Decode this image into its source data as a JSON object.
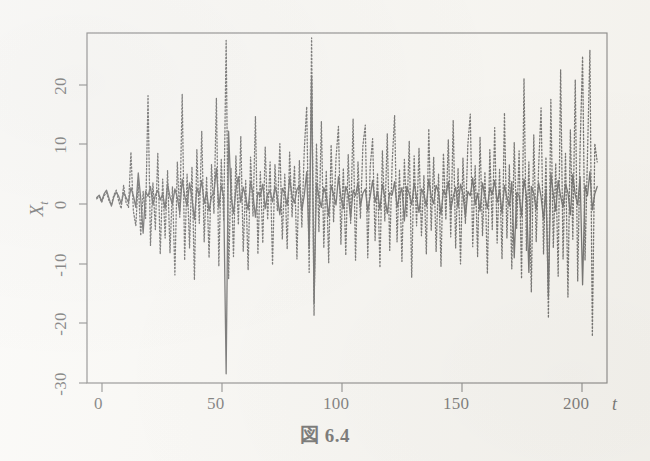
{
  "figure": {
    "caption": "図 6.4",
    "background_color": "#f7f6f2",
    "ink_color": "#111111"
  },
  "axes": {
    "y_title": "X",
    "y_subscript": "t",
    "x_title": "t",
    "y_ticks": [
      "20",
      "10",
      "0",
      "-10",
      "-20",
      "-30"
    ],
    "x_ticks": [
      "0",
      "50",
      "100",
      "150",
      "200"
    ]
  },
  "chart_data": {
    "type": "line",
    "title": "図 6.4",
    "xlabel": "t",
    "ylabel": "X_t",
    "xlim": [
      -4,
      209
    ],
    "ylim": [
      -30,
      27
    ],
    "yticks": [
      20,
      10,
      0,
      -10,
      -20,
      -30
    ],
    "xticks": [
      0,
      50,
      100,
      150,
      200
    ],
    "grid": false,
    "legend": "none",
    "series": [
      {
        "name": "solid-series",
        "style": "solid",
        "color": "#111111",
        "linewidth": 1.3,
        "values": [
          0.2,
          0.6,
          -0.4,
          0.8,
          1.4,
          0.1,
          -1.2,
          0.3,
          1.1,
          0.4,
          -0.8,
          1.0,
          0.2,
          -0.6,
          1.8,
          0.5,
          -1.4,
          4.2,
          0.1,
          -5.6,
          1.2,
          0.4,
          2.0,
          -1.0,
          0.6,
          1.4,
          -0.2,
          0.8,
          -1.6,
          2.4,
          0.3,
          -0.9,
          1.6,
          0.2,
          -2.2,
          3.2,
          0.5,
          -1.2,
          2.6,
          0.1,
          -3.4,
          1.8,
          0.6,
          3.0,
          -0.8,
          1.2,
          -2.0,
          0.4,
          1.0,
          5.0,
          -1.4,
          2.2,
          0.3,
          -28.5,
          11.0,
          0.6,
          -2.4,
          1.5,
          3.6,
          -0.6,
          1.9,
          0.2,
          -1.8,
          2.8,
          0.7,
          -3.0,
          1.1,
          0.4,
          2.4,
          -1.6,
          0.8,
          1.3,
          -0.5,
          2.0,
          0.2,
          -2.6,
          1.7,
          0.9,
          -1.1,
          3.4,
          0.4,
          -0.7,
          1.5,
          2.2,
          -1.9,
          0.6,
          4.4,
          -8.0,
          20.0,
          -17.0,
          2.6,
          0.3,
          -1.4,
          1.8,
          0.5,
          -2.8,
          2.2,
          0.7,
          -1.0,
          3.6,
          0.2,
          -1.6,
          2.0,
          0.8,
          -3.2,
          1.4,
          0.5,
          2.6,
          -1.2,
          0.9,
          1.6,
          -2.0,
          0.4,
          3.0,
          -0.6,
          1.2,
          -1.8,
          2.4,
          0.3,
          -2.4,
          1.0,
          0.6,
          2.8,
          -1.4,
          0.5,
          1.8,
          -3.6,
          2.0,
          0.8,
          -1.0,
          2.6,
          0.2,
          -2.2,
          1.6,
          0.7,
          -1.2,
          3.2,
          0.4,
          -0.8,
          2.2,
          1.0,
          -2.6,
          1.4,
          0.6,
          2.8,
          -1.8,
          0.3,
          1.9,
          -1.4,
          2.4,
          0.8,
          -3.0,
          1.2,
          0.5,
          3.4,
          -1.0,
          0.9,
          -2.0,
          2.6,
          0.4,
          -1.6,
          1.8,
          0.7,
          3.0,
          -0.6,
          1.4,
          -2.4,
          2.2,
          0.2,
          -1.2,
          2.8,
          -9.6,
          1.0,
          0.6,
          -2.8,
          3.2,
          0.5,
          -12.0,
          2.0,
          0.9,
          -1.8,
          2.6,
          0.3,
          -3.4,
          1.6,
          -16.0,
          4.2,
          0.8,
          -2.0,
          3.0,
          0.4,
          -1.4,
          2.4,
          1.0,
          -2.6,
          4.0,
          0.6,
          -1.0,
          3.6,
          -14.0,
          2.2,
          0.5,
          4.4,
          -1.8,
          0.8,
          2.0
        ]
      },
      {
        "name": "dotted-series",
        "style": "dotted",
        "color": "#111111",
        "linewidth": 1.3,
        "values": [
          0.0,
          0.4,
          -0.6,
          0.5,
          1.0,
          -0.3,
          -1.0,
          0.6,
          1.4,
          -0.4,
          -1.6,
          2.2,
          -0.6,
          -1.4,
          7.6,
          -2.0,
          -4.4,
          3.0,
          -6.0,
          1.2,
          -3.2,
          16.8,
          -7.6,
          2.6,
          -5.0,
          7.4,
          -9.0,
          3.2,
          -6.4,
          4.6,
          -8.8,
          2.0,
          -12.4,
          6.0,
          -3.0,
          17.0,
          -10.0,
          4.0,
          -8.0,
          5.2,
          -13.2,
          8.0,
          -4.0,
          11.0,
          -7.0,
          3.6,
          -9.6,
          5.6,
          -2.4,
          16.4,
          -11.0,
          6.4,
          -3.6,
          25.8,
          -13.0,
          5.0,
          -9.4,
          7.0,
          -4.2,
          10.2,
          -8.6,
          3.0,
          -11.6,
          6.8,
          -2.8,
          13.4,
          -9.0,
          4.4,
          -7.2,
          8.4,
          -3.4,
          6.0,
          -10.8,
          5.6,
          -2.0,
          9.0,
          -6.6,
          4.0,
          -8.2,
          7.6,
          -3.0,
          5.4,
          -9.8,
          6.2,
          -4.6,
          8.0,
          15.0,
          -12.0,
          26.2,
          -19.0,
          9.0,
          -5.4,
          12.6,
          -8.0,
          4.6,
          -10.4,
          8.8,
          -3.8,
          6.6,
          11.8,
          -7.4,
          5.0,
          -9.2,
          7.2,
          -4.0,
          13.0,
          -10.0,
          6.0,
          -3.2,
          8.6,
          12.0,
          -9.6,
          5.2,
          9.8,
          -6.8,
          4.2,
          -11.2,
          7.8,
          -3.6,
          10.6,
          -8.4,
          5.8,
          13.6,
          -7.0,
          4.8,
          -10.2,
          6.4,
          -3.0,
          9.4,
          -12.8,
          7.0,
          -4.4,
          8.2,
          -6.0,
          3.8,
          -9.0,
          11.4,
          -5.2,
          6.8,
          -8.6,
          4.0,
          -11.0,
          7.4,
          -3.4,
          9.6,
          -6.2,
          12.8,
          -8.0,
          5.0,
          -10.6,
          6.6,
          -4.0,
          8.8,
          13.8,
          -7.8,
          5.4,
          -9.4,
          10.0,
          -6.0,
          4.4,
          -12.2,
          8.0,
          -5.0,
          11.6,
          -7.2,
          4.8,
          -9.8,
          14.0,
          -6.4,
          5.6,
          -11.4,
          9.2,
          -4.8,
          7.8,
          -13.0,
          19.6,
          -8.4,
          6.0,
          -15.2,
          10.4,
          -7.0,
          5.2,
          14.8,
          -9.0,
          6.8,
          -19.4,
          16.2,
          -8.0,
          5.8,
          -12.6,
          21.0,
          -9.8,
          7.4,
          -16.0,
          11.2,
          -6.6,
          19.4,
          -13.4,
          8.6,
          23.2,
          -10.0,
          7.0,
          24.2,
          -22.4,
          9.0,
          6.0
        ]
      }
    ]
  }
}
